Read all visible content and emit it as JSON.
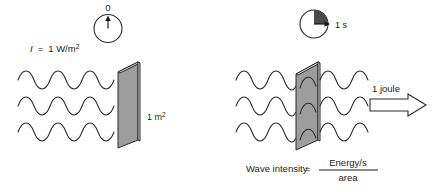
{
  "figure": {
    "background_color": "#ffffff",
    "ink_color": "#1a1a1a",
    "slab_fill_color": "#9d9d9d",
    "wedge_color": "#4a4a4a"
  },
  "left_panel": {
    "clock": {
      "label": "0",
      "hand_direction": "up",
      "elapsed_fraction": 0
    },
    "intensity_label": {
      "symbol": "I",
      "equals": "=",
      "value": "1 W/m",
      "exponent": "2",
      "full_text": "I = 1 W/m2"
    },
    "area_label": {
      "value": "1 m",
      "exponent": "2",
      "full_text": "1 m2"
    },
    "wave_rows": 3,
    "wave_cycles_per_row": 3.5
  },
  "right_panel": {
    "clock": {
      "label": "1 s",
      "hand_direction": "right",
      "elapsed_fraction": 0.25
    },
    "energy_label": "1 joule",
    "arrow": {
      "name": "energy-flow-arrow",
      "direction": "right"
    },
    "wave_rows": 3,
    "wave_cycles_before_slab": 3,
    "wave_cycles_after_slab": 1.5
  },
  "caption": {
    "lead": "Wave intensity",
    "equals": "=",
    "numerator": "Energy/s",
    "denominator": "area",
    "full_text": "Wave intensity = Energy/s / area"
  }
}
